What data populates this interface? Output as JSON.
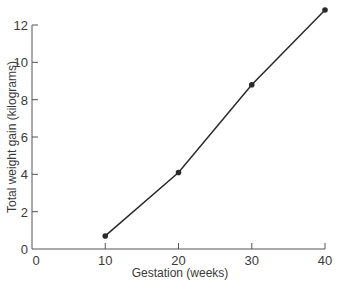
{
  "chart_data": {
    "type": "line",
    "title": "",
    "xlabel": "Gestation (weeks)",
    "ylabel": "Total weight gain (kilograms)",
    "x": [
      10,
      20,
      30,
      40
    ],
    "series": [
      {
        "name": "Total weight gain",
        "values": [
          0.7,
          4.1,
          8.8,
          12.8
        ],
        "markers": true
      }
    ],
    "xlim": [
      0,
      40
    ],
    "ylim": [
      0,
      12
    ],
    "x_ticks": [
      0,
      10,
      20,
      30,
      40
    ],
    "y_ticks": [
      0,
      2,
      4,
      6,
      8,
      10,
      12
    ],
    "grid": false,
    "legend": null,
    "colors": {
      "line": "#2a2a2a",
      "axis": "#555555",
      "text": "#3a3a3a"
    }
  },
  "labels": {
    "xlabel": "Gestation (weeks)",
    "ylabel": "Total weight gain (kilograms)"
  }
}
